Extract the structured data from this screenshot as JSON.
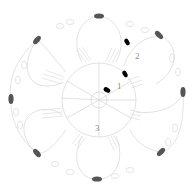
{
  "diagram": {
    "type": "crochet-motif-chart",
    "center": {
      "x": 99,
      "y": 100,
      "radius": 37
    },
    "petal_count": 6,
    "round_labels": [
      {
        "text": "1",
        "x": 117,
        "y": 89
      },
      {
        "text": "2",
        "x": 135,
        "y": 59
      },
      {
        "text": "3",
        "x": 95,
        "y": 131
      }
    ],
    "dark_markers": [
      {
        "x": 99,
        "y": 16,
        "rot": 0
      },
      {
        "x": 37,
        "y": 40,
        "rot": -50
      },
      {
        "x": 159,
        "y": 35,
        "rot": 45
      },
      {
        "x": 11,
        "y": 99,
        "rot": 90
      },
      {
        "x": 183,
        "y": 92,
        "rot": 90
      },
      {
        "x": 37,
        "y": 153,
        "rot": 50
      },
      {
        "x": 161,
        "y": 152,
        "rot": -45
      },
      {
        "x": 97,
        "y": 179,
        "rot": 0
      }
    ],
    "black_markers": [
      {
        "x": 127,
        "y": 42,
        "rot": 60
      },
      {
        "x": 125,
        "y": 74,
        "rot": 60
      },
      {
        "x": 107,
        "y": 90,
        "rot": 30
      }
    ],
    "colors": {
      "line": "#c8c8c8",
      "dark_marker": "#555555",
      "black_marker": "#000000",
      "label": "#8a8a8a"
    }
  }
}
